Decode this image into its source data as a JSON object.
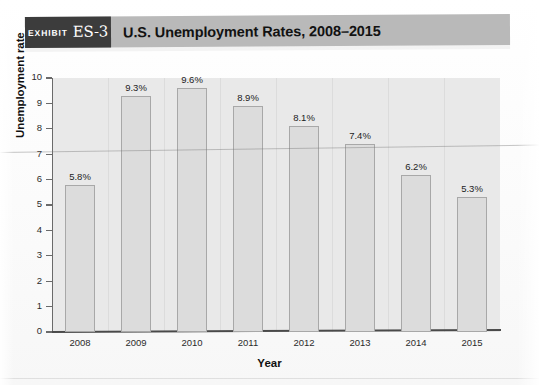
{
  "exhibit": {
    "label": "EXHIBIT",
    "number": "ES-3",
    "title": "U.S. Unemployment Rates, 2008–2015"
  },
  "colors": {
    "header_band": "#b9b9b9",
    "badge": "#3c3c3c",
    "plot_background": "#e9e9e9",
    "bar_fill": "#dcdcdc",
    "bar_stroke": "#a8a8a8",
    "axis": "#4a4a4a"
  },
  "chart_data": {
    "type": "bar",
    "title": "U.S. Unemployment Rates, 2008–2015",
    "categories": [
      "2008",
      "2009",
      "2010",
      "2011",
      "2012",
      "2013",
      "2014",
      "2015"
    ],
    "values": [
      5.8,
      9.3,
      9.6,
      8.9,
      8.1,
      7.4,
      6.2,
      5.3
    ],
    "data_labels": [
      "5.8%",
      "9.3%",
      "9.6%",
      "8.9%",
      "8.1%",
      "7.4%",
      "6.2%",
      "5.3%"
    ],
    "xlabel": "Year",
    "ylabel": "Unemployment rate",
    "ylim": [
      0,
      10
    ],
    "yticks": [
      0,
      1,
      2,
      3,
      4,
      5,
      6,
      7,
      8,
      9,
      10
    ],
    "ytick_labels": [
      "0",
      "1",
      "2",
      "3",
      "4",
      "5",
      "6",
      "7",
      "8",
      "9",
      "10"
    ],
    "grid": "vertical-category-separators",
    "legend": "none",
    "units": "percent"
  }
}
